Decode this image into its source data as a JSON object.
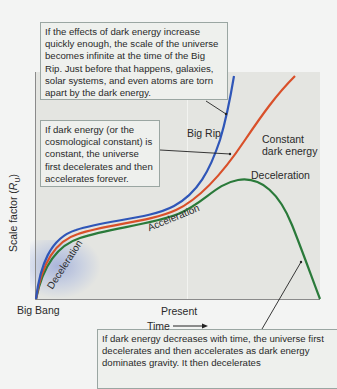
{
  "diagram": {
    "axes": {
      "y_label": "Scale factor (",
      "y_label_symbol": "R",
      "y_label_sub": "U",
      "y_label_end": ")",
      "x_label": "Time",
      "x_start": "Big Bang",
      "x_mid": "Present",
      "arrow": "right-arrow-icon"
    },
    "curves": [
      {
        "name": "Big Rip",
        "color": "#2f56b8"
      },
      {
        "name": "Constant dark energy",
        "color": "#d9502a"
      },
      {
        "name": "Deceleration",
        "color": "#2a7a3a"
      }
    ],
    "curve_labels": {
      "big_rip": "Big Rip",
      "constant_line1": "Constant",
      "constant_line2": "dark energy",
      "deceleration_late": "Deceleration",
      "deceleration_early": "Deceleration",
      "acceleration": "Acceleration"
    },
    "callouts": {
      "big_rip": "If the effects of dark energy increase quickly enough, the scale of the universe becomes infinite at the time of the Big Rip. Just before that happens, galaxies, solar systems, and even atoms are torn apart by the dark energy.",
      "constant": "If dark energy (or the cosmological constant) is constant, the universe first decelerates and then accelerates forever.",
      "decreasing": "If dark energy decreases with time, the universe first decelerates and then accelerates as dark energy dominates gravity. It then decelerates"
    }
  }
}
